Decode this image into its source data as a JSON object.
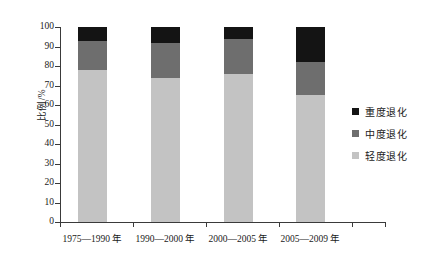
{
  "chart_data": {
    "type": "bar",
    "stacked": true,
    "title": "",
    "xlabel": "",
    "ylabel": "比例/%",
    "ylim": [
      0,
      100
    ],
    "yticks": [
      0,
      10,
      20,
      30,
      40,
      50,
      60,
      70,
      80,
      90,
      100
    ],
    "ytick_labels": [
      "0",
      "10",
      "20",
      "30",
      "40",
      "50",
      "60",
      "70",
      "80",
      "90",
      "100"
    ],
    "grid": false,
    "legend_position": "right",
    "categories": [
      "1975—1990 年",
      "1990—2000 年",
      "2000—2005 年",
      "2005—2009 年"
    ],
    "series": [
      {
        "name": "轻度退化",
        "color": "#c3c3c3",
        "values": [
          78,
          74,
          76,
          65
        ]
      },
      {
        "name": "中度退化",
        "color": "#6e6e6e",
        "values": [
          15,
          18,
          18,
          17
        ]
      },
      {
        "name": "重度退化",
        "color": "#141414",
        "values": [
          7,
          8,
          6,
          18
        ]
      }
    ],
    "legend_order": [
      "重度退化",
      "中度退化",
      "轻度退化"
    ],
    "cumulative_tops": [
      {
        "category": "1975—1990 年",
        "light_top": 78,
        "mid_top": 93,
        "dark_top": 100
      },
      {
        "category": "1990—2000 年",
        "light_top": 74,
        "mid_top": 92,
        "dark_top": 100
      },
      {
        "category": "2000—2005 年",
        "light_top": 76,
        "mid_top": 94,
        "dark_top": 100
      },
      {
        "category": "2005—2009 年",
        "light_top": 65,
        "mid_top": 82,
        "dark_top": 100
      }
    ]
  },
  "axis": {
    "y_title": "比例/%",
    "y_labels": [
      "100",
      "90",
      "80",
      "70",
      "60",
      "50",
      "40",
      "30",
      "20",
      "10",
      "0"
    ]
  },
  "legend": {
    "items": [
      {
        "label": "重度退化",
        "color": "#141414"
      },
      {
        "label": "中度退化",
        "color": "#6e6e6e"
      },
      {
        "label": "轻度退化",
        "color": "#c3c3c3"
      }
    ]
  },
  "x_labels": [
    "1975—1990 年",
    "1990—2000 年",
    "2000—2005 年",
    "2005—2009 年"
  ]
}
